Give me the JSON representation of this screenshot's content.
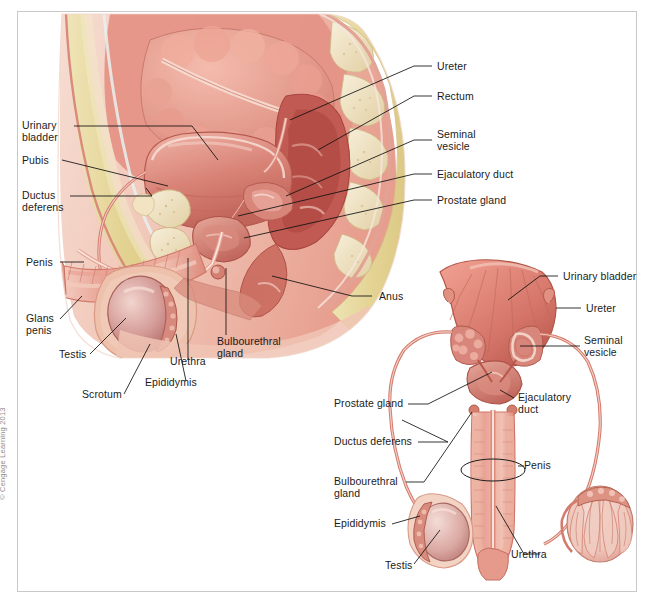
{
  "figure": {
    "copyright": "© Cengage Learning 2013",
    "views": [
      {
        "id": "sagittal",
        "name": "Midsagittal section of male pelvis"
      },
      {
        "id": "anterior",
        "name": "Anterior view of male reproductive organs"
      }
    ]
  },
  "colors": {
    "tissue_pink": "#e8a39a",
    "tissue_deep": "#c4625c",
    "tissue_light": "#f3cec6",
    "fat_yellow": "#e6d79c",
    "bone_cream": "#f0e4c8",
    "organ_red": "#cf6a60",
    "skin": "#f2c9bc",
    "outline": "#b4554c",
    "leader": "#111111",
    "text": "#1b1b1b",
    "frame": "#c9c9c9",
    "background": "#ffffff"
  },
  "labels": {
    "sagittal_left": [
      {
        "id": "urinary-bladder",
        "text": "Urinary\nbladder",
        "x": 22,
        "y": 120
      },
      {
        "id": "pubis",
        "text": "Pubis",
        "x": 22,
        "y": 155
      },
      {
        "id": "ductus-deferens",
        "text": "Ductus\ndeferens",
        "x": 22,
        "y": 190
      },
      {
        "id": "penis",
        "text": "Penis",
        "x": 26,
        "y": 258
      },
      {
        "id": "glans-penis",
        "text": "Glans\npenis",
        "x": 26,
        "y": 315
      },
      {
        "id": "testis",
        "text": "Testis",
        "x": 59,
        "y": 356
      },
      {
        "id": "scrotum",
        "text": "Scrotum",
        "x": 82,
        "y": 396
      },
      {
        "id": "epididymis",
        "text": "Epididymis",
        "x": 145,
        "y": 385
      },
      {
        "id": "urethra",
        "text": "Urethra",
        "x": 170,
        "y": 365
      },
      {
        "id": "bulbourethral-gland",
        "text": "Bulbourethral\ngland",
        "x": 217,
        "y": 341
      }
    ],
    "sagittal_right": [
      {
        "id": "ureter",
        "text": "Ureter",
        "x": 437,
        "y": 63
      },
      {
        "id": "rectum",
        "text": "Rectum",
        "x": 437,
        "y": 93
      },
      {
        "id": "seminal-vesicle",
        "text": "Seminal\nvesicle",
        "x": 437,
        "y": 131
      },
      {
        "id": "ejaculatory-duct",
        "text": "Ejaculatory duct",
        "x": 437,
        "y": 173
      },
      {
        "id": "prostate-gland",
        "text": "Prostate gland",
        "x": 437,
        "y": 199
      },
      {
        "id": "anus",
        "text": "Anus",
        "x": 377,
        "y": 293
      }
    ],
    "anterior_right": [
      {
        "id": "urinary-bladder-2",
        "text": "Urinary bladder",
        "x": 563,
        "y": 273
      },
      {
        "id": "ureter-2",
        "text": "Ureter",
        "x": 586,
        "y": 305
      },
      {
        "id": "seminal-vesicle-2",
        "text": "Seminal\nvesicle",
        "x": 584,
        "y": 337
      },
      {
        "id": "ejaculatory-duct-2",
        "text": "Ejaculatory\nduct",
        "x": 518,
        "y": 394
      },
      {
        "id": "penis-2",
        "text": "Penis",
        "x": 522,
        "y": 462
      },
      {
        "id": "urethra-2",
        "text": "Urethra",
        "x": 511,
        "y": 556
      }
    ],
    "anterior_left": [
      {
        "id": "prostate-gland-2",
        "text": "Prostate gland",
        "x": 334,
        "y": 401
      },
      {
        "id": "ductus-deferens-2",
        "text": "Ductus deferens",
        "x": 334,
        "y": 438
      },
      {
        "id": "bulbourethral-gland-2",
        "text": "Bulbourethral\ngland",
        "x": 334,
        "y": 479
      },
      {
        "id": "epididymis-2",
        "text": "Epididymis",
        "x": 334,
        "y": 521
      },
      {
        "id": "testis-2",
        "text": "Testis",
        "x": 383,
        "y": 567
      }
    ]
  }
}
